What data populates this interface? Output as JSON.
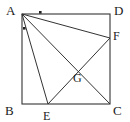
{
  "figure": {
    "type": "geometry-diagram",
    "stroke_color": "#333333",
    "background_color": "#ffffff",
    "label_color": "#1a1a1a"
  },
  "vertices": [
    {
      "id": "A",
      "label": "A",
      "x": 22,
      "y": 14,
      "label_x": 6,
      "label_y": 4
    },
    {
      "id": "B",
      "label": "B",
      "x": 22,
      "y": 104,
      "label_x": 5,
      "label_y": 104
    },
    {
      "id": "C",
      "label": "C",
      "x": 110,
      "y": 104,
      "label_x": 113,
      "label_y": 104
    },
    {
      "id": "D",
      "label": "D",
      "x": 110,
      "y": 14,
      "label_x": 114,
      "label_y": 4
    }
  ],
  "points": [
    {
      "id": "E",
      "label": "E",
      "x": 48,
      "y": 104,
      "label_x": 43,
      "label_y": 110
    },
    {
      "id": "F",
      "label": "F",
      "x": 110,
      "y": 38,
      "label_x": 113,
      "label_y": 30
    },
    {
      "id": "G",
      "label": "G",
      "x": 78,
      "y": 70,
      "label_x": 73,
      "label_y": 72
    }
  ],
  "square_sides": [
    {
      "name": "side-AD",
      "from": "A",
      "to": "D"
    },
    {
      "name": "side-AB",
      "from": "A",
      "to": "B"
    },
    {
      "name": "side-BC",
      "from": "B",
      "to": "C"
    },
    {
      "name": "side-DC",
      "from": "D",
      "to": "C"
    }
  ],
  "segments": [
    {
      "name": "segment-AF",
      "x1": 22,
      "y1": 14,
      "x2": 110,
      "y2": 38
    },
    {
      "name": "segment-AC",
      "x1": 22,
      "y1": 14,
      "x2": 110,
      "y2": 104
    },
    {
      "name": "segment-AE",
      "x1": 22,
      "y1": 14,
      "x2": 48,
      "y2": 104
    },
    {
      "name": "segment-EF",
      "x1": 48,
      "y1": 104,
      "x2": 110,
      "y2": 38
    }
  ],
  "angle_marks": [
    {
      "name": "angle-tick-top",
      "x": 40,
      "y": 12,
      "size": 2
    },
    {
      "name": "angle-tick-left",
      "x": 24,
      "y": 28,
      "size": 2
    }
  ]
}
